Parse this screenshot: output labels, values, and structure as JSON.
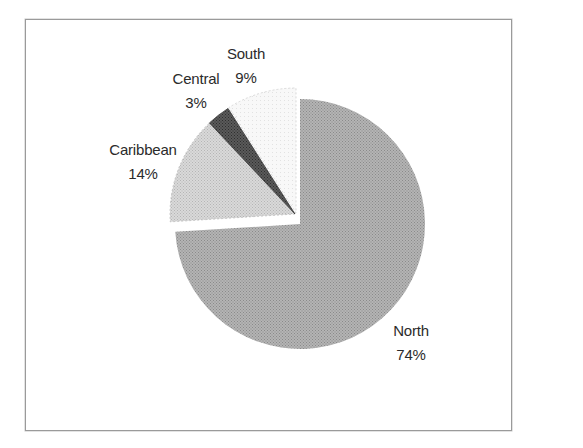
{
  "chart_data": {
    "type": "pie",
    "title": "",
    "categories": [
      "North",
      "Caribbean",
      "Central",
      "South"
    ],
    "values": [
      74,
      14,
      3,
      9
    ],
    "value_labels": [
      "74%",
      "14%",
      "3%",
      "9%"
    ],
    "unit": "%",
    "start_angle_deg": 0,
    "direction": "clockwise",
    "exploded": [
      "Caribbean",
      "Central",
      "South"
    ],
    "fills": {
      "North": "#a9a9a9",
      "Caribbean": "#cfcfcf",
      "Central": "#4a4a4a",
      "South": "#f4f4f4"
    },
    "legend": "none (data labels on slices)"
  },
  "labels": {
    "north": {
      "name": "North",
      "pct": "74%"
    },
    "caribbean": {
      "name": "Caribbean",
      "pct": "14%"
    },
    "central": {
      "name": "Central",
      "pct": "3%"
    },
    "south": {
      "name": "South",
      "pct": "9%"
    }
  }
}
